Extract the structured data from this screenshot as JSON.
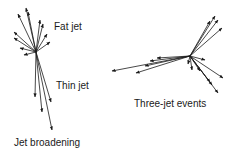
{
  "labels": {
    "fat_jet": "Fat jet",
    "thin_jet": "Thin jet",
    "jet_broadening": "Jet broadening",
    "three_jet_events": "Three-jet events"
  },
  "colors": {
    "stroke": "#1a1a1a",
    "background": "#ffffff"
  }
}
